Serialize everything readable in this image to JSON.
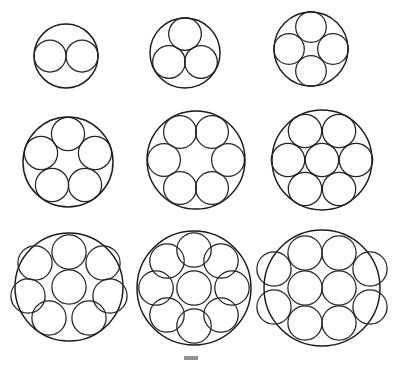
{
  "figure": {
    "background_color": "#ffffff",
    "stroke_color": "#1a1a1a",
    "width": 397,
    "height": 365,
    "rows": 3,
    "columns": 3,
    "partial_caption_visible": true
  },
  "chart_data": {
    "type": "scatter",
    "xlabel": "",
    "ylabel": "",
    "xlim": [
      0,
      397
    ],
    "ylim": [
      0,
      365
    ],
    "grid": false,
    "legend": "none",
    "annotation": "Nine packing diagrams, n = 2 through n = 10, arranged in a 3 x 3 grid; each shows n equal inner circles packed inside one enclosing circle.",
    "packings": [
      {
        "n": 2,
        "label": "n = 2",
        "arrangement": "two circles side by side on a diameter",
        "ring_count": 2,
        "center_count": 0,
        "enclosing": {
          "cx": 66,
          "cy": 56,
          "r": 32
        },
        "inner_radius": 16,
        "inner_circles": [
          {
            "cx": 50,
            "cy": 56
          },
          {
            "cx": 82,
            "cy": 56
          }
        ]
      },
      {
        "n": 3,
        "label": "n = 3",
        "arrangement": "equilateral triangle, one circle up",
        "ring_count": 3,
        "center_count": 0,
        "enclosing": {
          "cx": 185,
          "cy": 53,
          "r": 35
        },
        "inner_radius": 16.3,
        "inner_circles": [
          {
            "cx": 185,
            "cy": 34
          },
          {
            "cx": 169,
            "cy": 62
          },
          {
            "cx": 201,
            "cy": 62
          }
        ]
      },
      {
        "n": 4,
        "label": "n = 4",
        "arrangement": "square / diamond of four circles",
        "ring_count": 4,
        "center_count": 0,
        "enclosing": {
          "cx": 311,
          "cy": 49,
          "r": 37
        },
        "inner_radius": 15.3,
        "inner_circles": [
          {
            "cx": 311,
            "cy": 27
          },
          {
            "cx": 289,
            "cy": 49
          },
          {
            "cx": 333,
            "cy": 49
          },
          {
            "cx": 311,
            "cy": 71
          }
        ]
      },
      {
        "n": 5,
        "label": "n = 5",
        "arrangement": "regular pentagon ring, one circle up",
        "ring_count": 5,
        "center_count": 0,
        "enclosing": {
          "cx": 68,
          "cy": 162,
          "r": 45
        },
        "inner_radius": 16.6,
        "inner_circles": [
          {
            "cx": 68,
            "cy": 134
          },
          {
            "cx": 41,
            "cy": 153
          },
          {
            "cx": 95,
            "cy": 153
          },
          {
            "cx": 52,
            "cy": 185
          },
          {
            "cx": 85,
            "cy": 185
          }
        ]
      },
      {
        "n": 6,
        "label": "n = 6",
        "arrangement": "regular hexagon ring, hollow centre",
        "ring_count": 6,
        "center_count": 0,
        "enclosing": {
          "cx": 196,
          "cy": 160,
          "r": 49
        },
        "inner_radius": 16.4,
        "inner_circles": [
          {
            "cx": 180,
            "cy": 132
          },
          {
            "cx": 212,
            "cy": 132
          },
          {
            "cx": 164,
            "cy": 160
          },
          {
            "cx": 228,
            "cy": 160
          },
          {
            "cx": 180,
            "cy": 188
          },
          {
            "cx": 212,
            "cy": 188
          }
        ]
      },
      {
        "n": 7,
        "label": "n = 7",
        "arrangement": "hexagonal packing, six around one",
        "ring_count": 6,
        "center_count": 1,
        "enclosing": {
          "cx": 322,
          "cy": 160,
          "r": 50
        },
        "inner_radius": 16.7,
        "inner_circles": [
          {
            "cx": 322,
            "cy": 160
          },
          {
            "cx": 305,
            "cy": 131
          },
          {
            "cx": 339,
            "cy": 131
          },
          {
            "cx": 288,
            "cy": 160
          },
          {
            "cx": 356,
            "cy": 160
          },
          {
            "cx": 305,
            "cy": 189
          },
          {
            "cx": 339,
            "cy": 189
          }
        ]
      },
      {
        "n": 8,
        "label": "n = 8",
        "arrangement": "seven circle ring around one centre circle",
        "ring_count": 7,
        "center_count": 1,
        "enclosing": {
          "cx": 69,
          "cy": 287,
          "r": 54
        },
        "inner_radius": 17.1,
        "inner_circles": [
          {
            "cx": 69,
            "cy": 287
          },
          {
            "cx": 69,
            "cy": 252
          },
          {
            "cx": 35,
            "cy": 263
          },
          {
            "cx": 103,
            "cy": 263
          },
          {
            "cx": 28,
            "cy": 296
          },
          {
            "cx": 110,
            "cy": 296
          },
          {
            "cx": 49,
            "cy": 318
          },
          {
            "cx": 89,
            "cy": 318
          }
        ]
      },
      {
        "n": 9,
        "label": "n = 9",
        "arrangement": "eight circle ring around one centre circle",
        "ring_count": 8,
        "center_count": 1,
        "enclosing": {
          "cx": 194,
          "cy": 288,
          "r": 57
        },
        "inner_radius": 17.2,
        "inner_circles": [
          {
            "cx": 194,
            "cy": 288
          },
          {
            "cx": 194,
            "cy": 250
          },
          {
            "cx": 221,
            "cy": 261
          },
          {
            "cx": 232,
            "cy": 288
          },
          {
            "cx": 221,
            "cy": 315
          },
          {
            "cx": 194,
            "cy": 326
          },
          {
            "cx": 167,
            "cy": 315
          },
          {
            "cx": 156,
            "cy": 288
          },
          {
            "cx": 167,
            "cy": 261
          }
        ]
      },
      {
        "n": 10,
        "label": "n = 10",
        "arrangement": "eight circle outer ring with two circles in the centre",
        "ring_count": 8,
        "center_count": 2,
        "enclosing": {
          "cx": 322,
          "cy": 288,
          "r": 58
        },
        "inner_radius": 17.1,
        "inner_circles": [
          {
            "cx": 305,
            "cy": 288
          },
          {
            "cx": 339,
            "cy": 288
          },
          {
            "cx": 305,
            "cy": 253
          },
          {
            "cx": 339,
            "cy": 253
          },
          {
            "cx": 274,
            "cy": 269
          },
          {
            "cx": 370,
            "cy": 269
          },
          {
            "cx": 274,
            "cy": 307
          },
          {
            "cx": 370,
            "cy": 307
          },
          {
            "cx": 305,
            "cy": 323
          },
          {
            "cx": 339,
            "cy": 323
          }
        ]
      }
    ]
  }
}
